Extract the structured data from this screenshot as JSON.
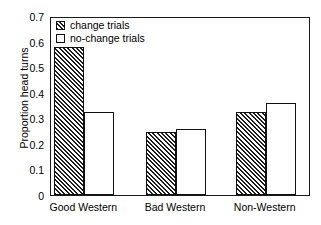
{
  "chart_data": {
    "type": "bar",
    "title": "",
    "xlabel": "",
    "ylabel": "Proportion head turns",
    "categories": [
      "Good Western",
      "Bad Western",
      "Non-Western"
    ],
    "series": [
      {
        "name": "change trials",
        "values": [
          0.58,
          0.245,
          0.325
        ],
        "fill": "hatched"
      },
      {
        "name": "no-change trials",
        "values": [
          0.325,
          0.26,
          0.36
        ],
        "fill": "open"
      }
    ],
    "ylim": [
      0,
      0.7
    ],
    "yticks": [
      "0",
      "0.1",
      "0.2",
      "0.3",
      "0.4",
      "0.5",
      "0.6",
      "0.7"
    ],
    "ytick_values": [
      0,
      0.1,
      0.2,
      0.3,
      0.4,
      0.5,
      0.6,
      0.7
    ],
    "grid": false,
    "legend_position": "upper-left-inside",
    "colors": {
      "axis": "#1a1a1a",
      "bar_edge": "#111111",
      "hatch": "#1c1c1c",
      "background": "#ffffff"
    }
  },
  "legend": {
    "items": [
      {
        "label": "change trials"
      },
      {
        "label": "no-change trials"
      }
    ]
  }
}
